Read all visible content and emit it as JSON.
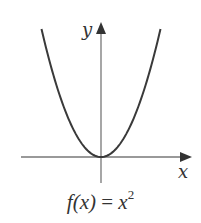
{
  "chart_data": {
    "type": "line",
    "xlabel": "x",
    "ylabel": "y",
    "function": "x^2",
    "grid": false,
    "legend": null,
    "x": [
      -2,
      -1.5,
      -1,
      -0.5,
      0,
      0.5,
      1,
      1.5,
      2
    ],
    "series": [
      {
        "name": "f(x) = x^2",
        "values": [
          4,
          2.25,
          1,
          0.25,
          0,
          0.25,
          1,
          2.25,
          4
        ]
      }
    ],
    "axis_color": "#777777",
    "curve_color": "#3a3a3a"
  },
  "labels": {
    "x_axis": "x",
    "y_axis": "y",
    "formula_fx": "f(x)",
    "formula_eq": "=",
    "formula_base": "x",
    "formula_exp": "2"
  }
}
